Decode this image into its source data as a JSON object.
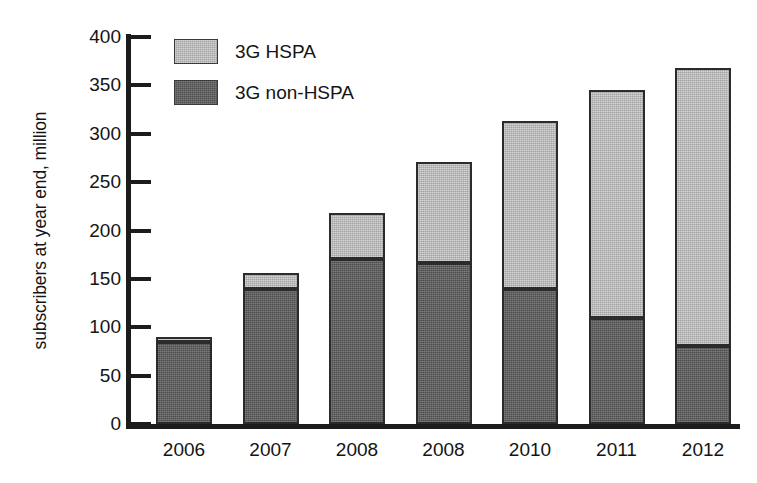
{
  "chart_data": {
    "type": "bar",
    "stacked": true,
    "title": "",
    "xlabel": "",
    "ylabel": "subscribers at year end, million",
    "categories": [
      "2006",
      "2007",
      "2008",
      "2008",
      "2010",
      "2011",
      "2012"
    ],
    "series": [
      {
        "name": "3G non-HSPA",
        "color": "#5e5e5e",
        "values": [
          85,
          140,
          171,
          166,
          140,
          110,
          81
        ]
      },
      {
        "name": "3G HSPA",
        "color": "#b4b4b4",
        "values": [
          5,
          16,
          47,
          105,
          173,
          235,
          287
        ]
      }
    ],
    "totals": [
      90,
      156,
      218,
      271,
      313,
      345,
      368
    ],
    "ylim": [
      0,
      400
    ],
    "ytick_labels": [
      "400",
      "350",
      "300",
      "250",
      "200",
      "150",
      "100",
      "50",
      "0"
    ],
    "ytick_values": [
      400,
      350,
      300,
      250,
      200,
      150,
      100,
      50,
      0
    ],
    "grid": false,
    "legend_position": "top-left",
    "stack_order_top_to_bottom": [
      "3G HSPA",
      "3G non-HSPA"
    ]
  },
  "legend": {
    "items": [
      {
        "label": "3G HSPA",
        "swatch": "light-gray-swatch"
      },
      {
        "label": "3G non-HSPA",
        "swatch": "dark-gray-swatch"
      }
    ]
  },
  "axes": {
    "y_title": "subscribers at year end, million"
  }
}
